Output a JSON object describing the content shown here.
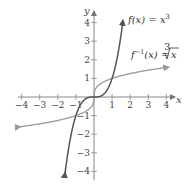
{
  "chart_data": {
    "type": "line",
    "title": "",
    "xlabel": "x",
    "ylabel": "y",
    "xlim": [
      -4,
      4
    ],
    "ylim": [
      -4,
      4
    ],
    "grid": false,
    "x_ticks": [
      -4,
      -3,
      -2,
      -1,
      1,
      2,
      3,
      4
    ],
    "y_ticks": [
      4,
      3,
      2,
      1,
      -1,
      -2,
      -3,
      -4
    ],
    "x_tick_labels": [
      "−4",
      "−3",
      "−2",
      "−1",
      "1",
      "2",
      "3",
      "4"
    ],
    "y_tick_labels": [
      "4",
      "3",
      "2",
      "1",
      "−1",
      "−2",
      "−3",
      "−4"
    ],
    "series": [
      {
        "name": "f(x) = x^3",
        "label_main": "f(x) = x",
        "label_sup": "3",
        "color": "#555555",
        "x": [
          -1.6,
          -1.4,
          -1.2,
          -1,
          -0.8,
          -0.6,
          -0.4,
          -0.2,
          0,
          0.2,
          0.4,
          0.6,
          0.8,
          1,
          1.2,
          1.4,
          1.6
        ],
        "y": [
          -4.1,
          -2.74,
          -1.73,
          -1,
          -0.51,
          -0.22,
          -0.06,
          -0.01,
          0,
          0.01,
          0.06,
          0.22,
          0.51,
          1,
          1.73,
          2.74,
          4.1
        ]
      },
      {
        "name": "f^-1(x) = cube root of x",
        "label_main": "f",
        "label_sup": "−1",
        "label_rest": "(x) =",
        "label_radical_index": "3",
        "label_radicand": "x",
        "color": "#9a9a9a",
        "x": [
          -4.1,
          -3,
          -2,
          -1,
          -0.5,
          -0.2,
          -0.05,
          0,
          0.05,
          0.2,
          0.5,
          1,
          2,
          3,
          4.1
        ],
        "y": [
          -1.6,
          -1.44,
          -1.26,
          -1,
          -0.79,
          -0.58,
          -0.37,
          0,
          0.37,
          0.58,
          0.79,
          1,
          1.26,
          1.44,
          1.6
        ]
      }
    ],
    "legend": "inline labels near curves",
    "annotations": [
      "f(x) = x³",
      "f⁻¹(x) = ∛x"
    ]
  },
  "axes": {
    "x_label": "x",
    "y_label": "y"
  }
}
